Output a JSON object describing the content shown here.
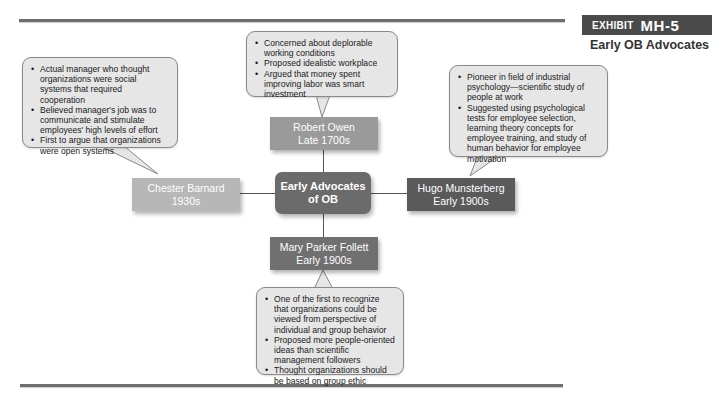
{
  "exhibit": {
    "label": "EXHIBIT",
    "number": "MH-5",
    "title": "Early OB Advocates"
  },
  "colors": {
    "center": "#6b6b6b",
    "robert_owen": "#9a9a9a",
    "chester_barnard": "#b7b7b7",
    "hugo_munsterberg": "#5a5a5a",
    "mary_parker_follett": "#707070",
    "callout_fill": "#e6e6e6",
    "rule": "#6e6e6e"
  },
  "center": {
    "line1": "Early Advocates",
    "line2": "of OB"
  },
  "advocates": {
    "robert_owen": {
      "name": "Robert Owen",
      "era": "Late 1700s",
      "points": [
        "Concerned about deplorable working conditions",
        "Proposed idealistic workplace",
        "Argued that money spent improving labor was smart investment"
      ]
    },
    "chester_barnard": {
      "name": "Chester Barnard",
      "era": "1930s",
      "points": [
        "Actual manager who thought organizations were social systems that required cooperation",
        "Believed manager's job was to communicate and stimulate employees' high levels of effort",
        "First to argue that organizations were open systems"
      ]
    },
    "hugo_munsterberg": {
      "name": "Hugo Munsterberg",
      "era": "Early 1900s",
      "points": [
        "Pioneer in field of industrial psychology—scientific study of people at work",
        "Suggested using psychological tests for employee selection, learning theory concepts for employee training, and study of human behavior for employee motivation"
      ]
    },
    "mary_parker_follett": {
      "name": "Mary Parker Follett",
      "era": "Early 1900s",
      "points": [
        "One of the first to recognize that organizations could be viewed from perspective of individual and group behavior",
        "Proposed more people-oriented ideas than scientific management followers",
        "Thought organizations should be based on group ethic"
      ]
    }
  }
}
